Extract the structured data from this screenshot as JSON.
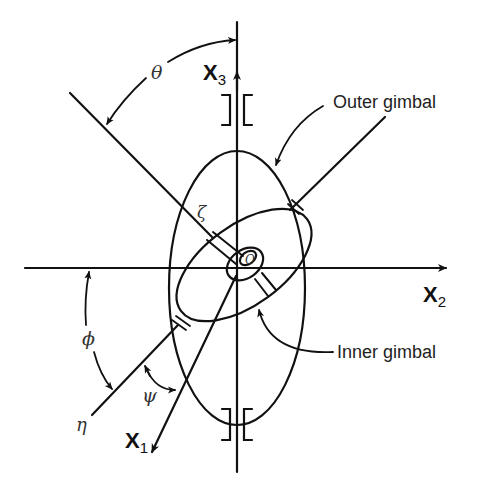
{
  "diagram": {
    "axes": {
      "x1": {
        "label": "X",
        "sub": "1"
      },
      "x2": {
        "label": "X",
        "sub": "2"
      },
      "x3": {
        "label": "X",
        "sub": "3"
      }
    },
    "angles": {
      "theta": "θ",
      "phi": "ϕ",
      "psi": "ψ"
    },
    "lines": {
      "zeta": "ζ",
      "eta": "η"
    },
    "center": "O",
    "callouts": {
      "outer_gimbal": "Outer gimbal",
      "inner_gimbal": "Inner gimbal"
    },
    "colors": {
      "stroke": "#111111",
      "background": "#ffffff"
    }
  }
}
